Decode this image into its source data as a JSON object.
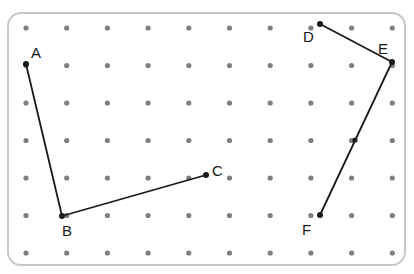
{
  "figure": {
    "canvas": {
      "width": 414,
      "height": 274
    },
    "board": {
      "name": "geoboard-panel",
      "x": 7,
      "y": 12,
      "width": 399,
      "height": 254,
      "corner_radius": 13,
      "fill": "#ffffff",
      "stroke": "#c8c8c8",
      "stroke_width": 2
    },
    "grid": {
      "columns": 10,
      "rows": 7,
      "origin_x": 26,
      "origin_y": 28,
      "spacing_x": 40.7,
      "spacing_y": 37.5,
      "dot_radius": 2.6,
      "dot_color": "#7f7f7f"
    },
    "line_color": "#1a1a1a",
    "line_width": 1.8,
    "vertex_dot_radius": 3.0,
    "vertex_dot_color": "#1a1a1a",
    "paths": [
      {
        "id": "path-abc",
        "name": "polyline-a-b-c",
        "label": "A-B-C",
        "points": "26,64 62,216 206,175"
      },
      {
        "id": "path-def",
        "name": "polyline-d-e-f",
        "label": "D-E-F",
        "points": "320,24 392,62 320,215"
      }
    ],
    "points": [
      {
        "id": "A",
        "label": "A",
        "x": 26,
        "y": 64,
        "label_x": 31,
        "label_y": 58
      },
      {
        "id": "B",
        "label": "B",
        "x": 62,
        "y": 216,
        "label_x": 62,
        "label_y": 236
      },
      {
        "id": "C",
        "label": "C",
        "x": 206,
        "y": 175,
        "label_x": 212,
        "label_y": 176
      },
      {
        "id": "D",
        "label": "D",
        "x": 320,
        "y": 24,
        "label_x": 303,
        "label_y": 42
      },
      {
        "id": "E",
        "label": "E",
        "x": 392,
        "y": 62,
        "label_x": 378,
        "label_y": 54
      },
      {
        "id": "F",
        "label": "F",
        "x": 320,
        "y": 215,
        "label_x": 302,
        "label_y": 235
      }
    ],
    "midpoint_marks": [
      {
        "id": "EF-mid",
        "name": "midpoint-mark-ef",
        "x": 355,
        "y": 140,
        "radius": 2.6
      }
    ]
  }
}
